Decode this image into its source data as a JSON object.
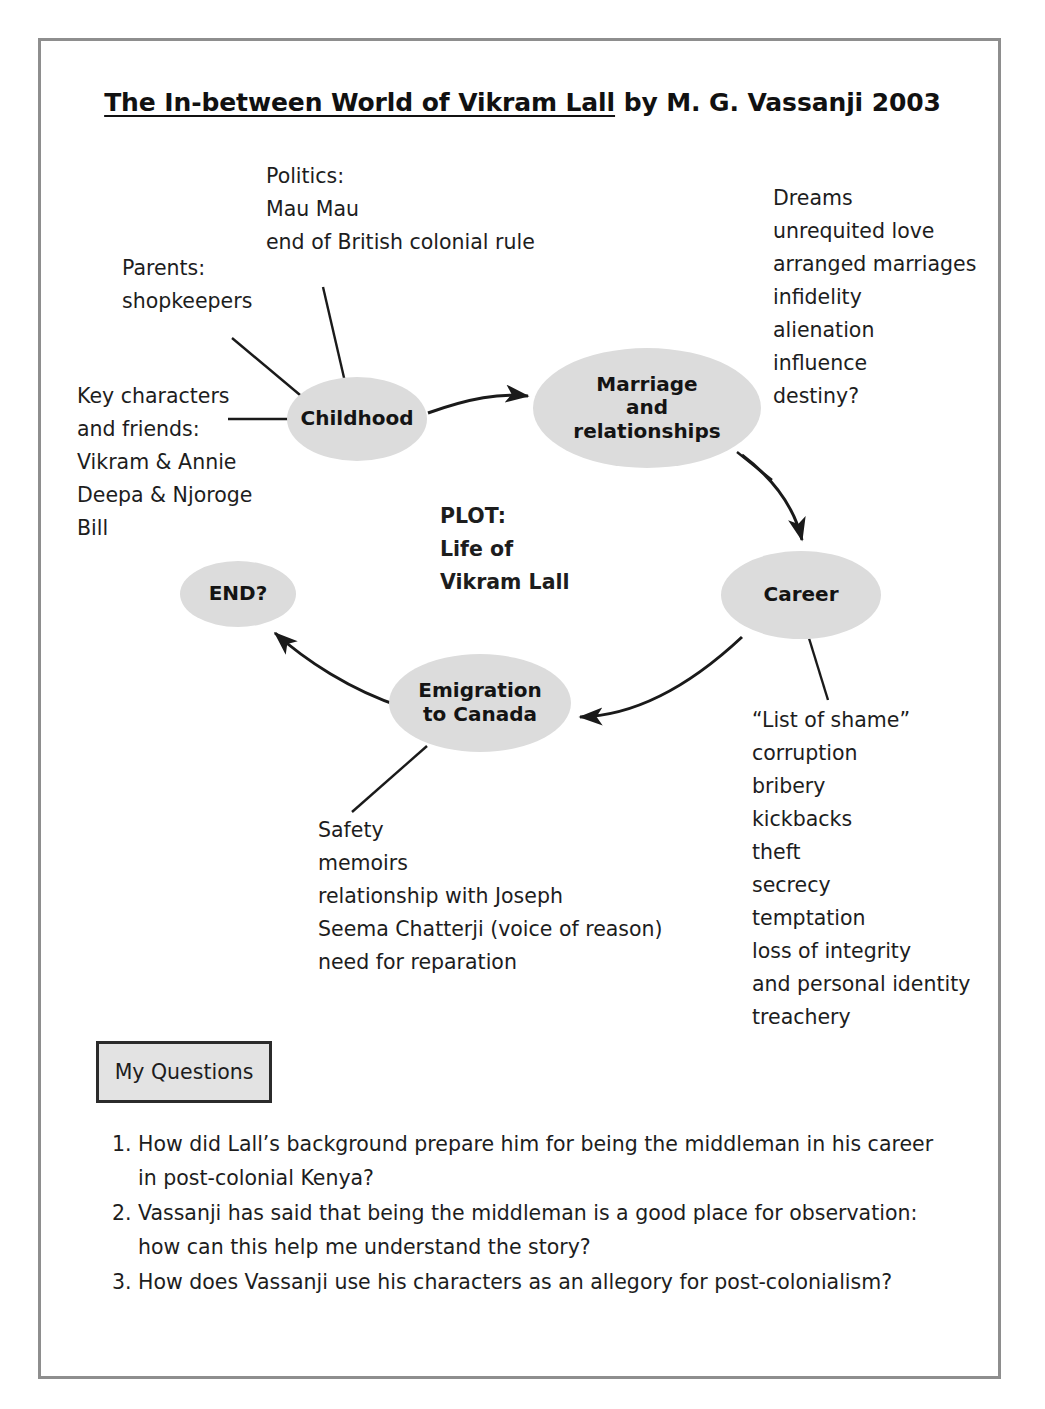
{
  "document": {
    "title_underlined": "The In-between World of Vikram Lall",
    "title_rest": " by M. G. Vassanji 2003"
  },
  "diagram": {
    "nodes": [
      {
        "id": "childhood",
        "label": "Childhood"
      },
      {
        "id": "marriage",
        "label": "Marriage and relationships"
      },
      {
        "id": "career",
        "label": "Career"
      },
      {
        "id": "emigration",
        "label": "Emigration to Canada"
      },
      {
        "id": "end",
        "label": "END?"
      }
    ],
    "node_labels": {
      "childhood": "Childhood",
      "marriage_line1": "Marriage",
      "marriage_line2": "and",
      "marriage_line3": "relationships",
      "career": "Career",
      "emigration_line1": "Emigration",
      "emigration_line2": "to Canada",
      "end": "END?"
    },
    "center_label": {
      "line1": "PLOT:",
      "line2": "Life of",
      "line3": "Vikram Lall"
    },
    "annotations": {
      "politics": {
        "lines": [
          "Politics:",
          "Mau Mau",
          "end of British colonial rule"
        ]
      },
      "parents": {
        "lines": [
          "Parents:",
          "shopkeepers"
        ]
      },
      "key_characters": {
        "lines": [
          "Key characters",
          "and friends:",
          "Vikram & Annie",
          "Deepa & Njoroge",
          "Bill"
        ]
      },
      "marriage_themes": {
        "lines": [
          "Dreams",
          "unrequited love",
          "arranged marriages",
          "infidelity",
          "alienation",
          "influence",
          "destiny?"
        ]
      },
      "career_themes": {
        "lines": [
          "“List of shame”",
          "corruption",
          "bribery",
          "kickbacks",
          "theft",
          "secrecy",
          "temptation",
          "loss of integrity",
          "and personal identity",
          "treachery"
        ]
      },
      "emigration_themes": {
        "lines": [
          "Safety",
          "memoirs",
          "relationship with Joseph",
          "Seema Chatterji (voice of reason)",
          "need for reparation"
        ]
      }
    },
    "colors": {
      "node_fill": "#dcdcdc",
      "frame_border": "#8e8e8e",
      "arrow_stroke": "#1a1a1a",
      "questions_box_fill": "#e3e3e3",
      "questions_box_border": "#2b2b2b"
    }
  },
  "questions_section": {
    "box_label": "My Questions",
    "items": [
      {
        "number": "1.",
        "lines": [
          "How did Lall’s background prepare him for being the middleman in his career",
          "in post-colonial Kenya?"
        ]
      },
      {
        "number": "2.",
        "lines": [
          "Vassanji has said that being the middleman is a good place for observation:",
          "how can this help me understand the story?"
        ]
      },
      {
        "number": "3.",
        "lines": [
          "How does Vassanji use his characters as an allegory for post-colonialism?"
        ]
      }
    ]
  }
}
